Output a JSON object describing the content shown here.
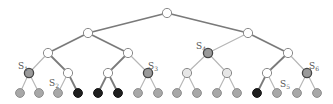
{
  "diagram": {
    "type": "binary-tree",
    "depth": 4,
    "colors": {
      "background": "#ffffff",
      "edge_strong": "#7a7a7a",
      "edge_light": "#b5b5b5",
      "node_white_fill": "#ffffff",
      "node_white_stroke": "#8a8a8a",
      "node_gray_fill": "#a8a8a8",
      "node_gray_stroke": "#8c8c8c",
      "node_marked_fill": "#9a9a9a",
      "node_marked_stroke": "#444444",
      "node_black_fill": "#1e1e1e",
      "label": "#555555"
    },
    "nodes": [
      {
        "id": "r",
        "x": 167,
        "y": 13,
        "type": "white"
      },
      {
        "id": "a",
        "x": 88,
        "y": 33,
        "type": "white"
      },
      {
        "id": "b",
        "x": 248,
        "y": 33,
        "type": "white"
      },
      {
        "id": "aa",
        "x": 48,
        "y": 53,
        "type": "white"
      },
      {
        "id": "ab",
        "x": 128,
        "y": 53,
        "type": "white"
      },
      {
        "id": "ba",
        "x": 208,
        "y": 53,
        "type": "marked"
      },
      {
        "id": "bb",
        "x": 288,
        "y": 53,
        "type": "white"
      },
      {
        "id": "aaa",
        "x": 29,
        "y": 73,
        "type": "marked"
      },
      {
        "id": "aab",
        "x": 68,
        "y": 73,
        "type": "white"
      },
      {
        "id": "aba",
        "x": 108,
        "y": 73,
        "type": "white"
      },
      {
        "id": "abb",
        "x": 148,
        "y": 73,
        "type": "marked"
      },
      {
        "id": "baa",
        "x": 187,
        "y": 73,
        "type": "pale"
      },
      {
        "id": "bab",
        "x": 227,
        "y": 73,
        "type": "pale"
      },
      {
        "id": "bba",
        "x": 267,
        "y": 73,
        "type": "white"
      },
      {
        "id": "bbb",
        "x": 307,
        "y": 73,
        "type": "marked"
      },
      {
        "id": "l1",
        "x": 20,
        "y": 93,
        "type": "gray"
      },
      {
        "id": "l2",
        "x": 39,
        "y": 93,
        "type": "gray"
      },
      {
        "id": "l3",
        "x": 58,
        "y": 93,
        "type": "gray"
      },
      {
        "id": "l4",
        "x": 78,
        "y": 93,
        "type": "black"
      },
      {
        "id": "l5",
        "x": 98,
        "y": 93,
        "type": "black"
      },
      {
        "id": "l6",
        "x": 118,
        "y": 93,
        "type": "black"
      },
      {
        "id": "l7",
        "x": 138,
        "y": 93,
        "type": "gray"
      },
      {
        "id": "l8",
        "x": 158,
        "y": 93,
        "type": "gray"
      },
      {
        "id": "l9",
        "x": 177,
        "y": 93,
        "type": "gray"
      },
      {
        "id": "l10",
        "x": 197,
        "y": 93,
        "type": "gray"
      },
      {
        "id": "l11",
        "x": 217,
        "y": 93,
        "type": "gray"
      },
      {
        "id": "l12",
        "x": 237,
        "y": 93,
        "type": "gray"
      },
      {
        "id": "l13",
        "x": 257,
        "y": 93,
        "type": "black"
      },
      {
        "id": "l14",
        "x": 277,
        "y": 93,
        "type": "gray"
      },
      {
        "id": "l15",
        "x": 297,
        "y": 93,
        "type": "gray"
      },
      {
        "id": "l16",
        "x": 317,
        "y": 93,
        "type": "gray"
      }
    ],
    "edges": [
      [
        "r",
        "a",
        "strong"
      ],
      [
        "r",
        "b",
        "strong"
      ],
      [
        "a",
        "aa",
        "strong"
      ],
      [
        "a",
        "ab",
        "strong"
      ],
      [
        "b",
        "ba",
        "light"
      ],
      [
        "b",
        "bb",
        "strong"
      ],
      [
        "aa",
        "aaa",
        "light"
      ],
      [
        "aa",
        "aab",
        "strong"
      ],
      [
        "ab",
        "aba",
        "strong"
      ],
      [
        "ab",
        "abb",
        "light"
      ],
      [
        "ba",
        "baa",
        "light"
      ],
      [
        "ba",
        "bab",
        "light"
      ],
      [
        "bb",
        "bba",
        "strong"
      ],
      [
        "bb",
        "bbb",
        "light"
      ],
      [
        "aaa",
        "l1",
        "light"
      ],
      [
        "aaa",
        "l2",
        "light"
      ],
      [
        "aab",
        "l3",
        "light"
      ],
      [
        "aab",
        "l4",
        "strong"
      ],
      [
        "aba",
        "l5",
        "strong"
      ],
      [
        "aba",
        "l6",
        "strong"
      ],
      [
        "abb",
        "l7",
        "light"
      ],
      [
        "abb",
        "l8",
        "light"
      ],
      [
        "baa",
        "l9",
        "light"
      ],
      [
        "baa",
        "l10",
        "light"
      ],
      [
        "bab",
        "l11",
        "light"
      ],
      [
        "bab",
        "l12",
        "light"
      ],
      [
        "bba",
        "l13",
        "strong"
      ],
      [
        "bba",
        "l14",
        "light"
      ],
      [
        "bbb",
        "l15",
        "light"
      ],
      [
        "bbb",
        "l16",
        "light"
      ]
    ],
    "labels": [
      {
        "base": "S",
        "sub": "1",
        "x": 18,
        "y": 69,
        "node": "aaa"
      },
      {
        "base": "S",
        "sub": "2",
        "x": 49,
        "y": 86,
        "node": "l3"
      },
      {
        "base": "S",
        "sub": "3",
        "x": 148,
        "y": 69,
        "node": "abb"
      },
      {
        "base": "S",
        "sub": "4",
        "x": 196,
        "y": 49,
        "node": "ba"
      },
      {
        "base": "S",
        "sub": "5",
        "x": 280,
        "y": 87,
        "node": "l14"
      },
      {
        "base": "S",
        "sub": "6",
        "x": 309,
        "y": 69,
        "node": "bbb"
      }
    ]
  }
}
